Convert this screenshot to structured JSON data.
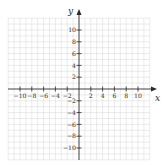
{
  "graph": {
    "type": "coordinate-plane",
    "x_axis": {
      "label": "x",
      "min": -12,
      "max": 12,
      "tick_step": 2,
      "tick_labels": [
        "−10",
        "−8",
        "−6",
        "−4",
        "−2",
        "2",
        "4",
        "6",
        "8",
        "10"
      ],
      "tick_values": [
        -10,
        -8,
        -6,
        -4,
        -2,
        2,
        4,
        6,
        8,
        10
      ]
    },
    "y_axis": {
      "label": "y",
      "min": -12,
      "max": 12,
      "tick_step": 2,
      "tick_labels": [
        "10",
        "8",
        "6",
        "4",
        "2",
        "−2",
        "−4",
        "−6",
        "−8",
        "−10"
      ],
      "tick_values": [
        10,
        8,
        6,
        4,
        2,
        -2,
        -4,
        -6,
        -8,
        -10
      ]
    },
    "grid": {
      "on": true,
      "step": 1
    },
    "colors": {
      "background": "#ffffff",
      "grid": "#d6d6d6",
      "axis": "#2a2a2a",
      "text": "#2a2a2a"
    }
  }
}
